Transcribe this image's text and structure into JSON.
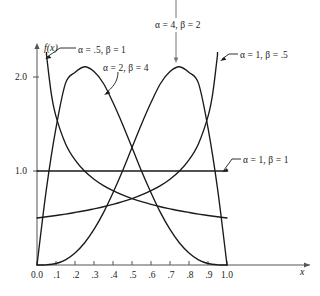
{
  "chart_data": {
    "type": "line",
    "title": "",
    "xlabel": "x",
    "ylabel": "f(x)",
    "xlim": [
      0.0,
      1.0
    ],
    "ylim": [
      0.0,
      2.25
    ],
    "grid": false,
    "legend_position": "inline-annotations",
    "x_ticks": [
      0.0,
      0.1,
      0.2,
      0.3,
      0.4,
      0.5,
      0.6,
      0.7,
      0.8,
      0.9,
      1.0
    ],
    "x_tick_labels": [
      "0.0",
      ".1",
      ".2",
      ".3",
      ".4",
      ".5",
      ".6",
      ".7",
      ".8",
      ".9",
      "1.0"
    ],
    "y_ticks": [
      1.0,
      2.0
    ],
    "y_tick_labels": [
      "1.0",
      "2.0"
    ],
    "series": [
      {
        "name": "alpha = .5, beta = 1",
        "alpha": 0.5,
        "beta": 1,
        "label": "α = .5, β = 1",
        "clipped_at_top": true,
        "x": [
          0.05,
          0.075,
          0.1,
          0.15,
          0.2,
          0.25,
          0.3,
          0.35,
          0.4,
          0.45,
          0.5,
          0.55,
          0.6,
          0.65,
          0.7,
          0.75,
          0.8,
          0.85,
          0.9,
          0.95,
          1.0
        ],
        "y": [
          2.236,
          1.826,
          1.581,
          1.291,
          1.118,
          1.0,
          0.913,
          0.845,
          0.791,
          0.745,
          0.707,
          0.674,
          0.645,
          0.62,
          0.598,
          0.577,
          0.559,
          0.542,
          0.527,
          0.513,
          0.5
        ]
      },
      {
        "name": "alpha = 2, beta = 4",
        "alpha": 2,
        "beta": 4,
        "label": "α = 2, β = 4",
        "clipped_at_top": false,
        "x": [
          0.0,
          0.05,
          0.1,
          0.15,
          0.2,
          0.25,
          0.3,
          0.35,
          0.4,
          0.45,
          0.5,
          0.55,
          0.6,
          0.65,
          0.7,
          0.75,
          0.8,
          0.85,
          0.9,
          0.95,
          1.0
        ],
        "y": [
          0.0,
          0.815,
          1.458,
          1.932,
          2.048,
          2.109,
          2.058,
          1.931,
          1.728,
          1.498,
          1.25,
          0.999,
          0.768,
          0.557,
          0.378,
          0.234,
          0.128,
          0.055,
          0.016,
          0.002,
          0.0
        ]
      },
      {
        "name": "alpha = 1, beta = 1",
        "alpha": 1,
        "beta": 1,
        "label": "α = 1, β = 1",
        "clipped_at_top": false,
        "x": [
          0.0,
          1.0
        ],
        "y": [
          1.0,
          1.0
        ]
      },
      {
        "name": "alpha = 4, beta = 2",
        "alpha": 4,
        "beta": 2,
        "label": "α = 4, β = 2",
        "clipped_at_top": false,
        "x": [
          0.0,
          0.05,
          0.1,
          0.15,
          0.2,
          0.25,
          0.3,
          0.35,
          0.4,
          0.45,
          0.5,
          0.55,
          0.6,
          0.65,
          0.7,
          0.75,
          0.8,
          0.85,
          0.9,
          0.95,
          1.0
        ],
        "y": [
          0.0,
          0.002,
          0.016,
          0.055,
          0.128,
          0.234,
          0.378,
          0.557,
          0.768,
          0.999,
          1.25,
          1.498,
          1.728,
          1.931,
          2.058,
          2.109,
          2.048,
          1.932,
          1.458,
          0.815,
          0.0
        ]
      },
      {
        "name": "alpha = 1, beta = .5",
        "alpha": 1,
        "beta": 0.5,
        "label": "α = 1, β = .5",
        "clipped_at_top": true,
        "x": [
          0.0,
          0.05,
          0.1,
          0.15,
          0.2,
          0.25,
          0.3,
          0.35,
          0.4,
          0.45,
          0.5,
          0.55,
          0.6,
          0.65,
          0.7,
          0.75,
          0.8,
          0.85,
          0.9,
          0.925,
          0.95
        ],
        "y": [
          0.5,
          0.513,
          0.527,
          0.542,
          0.559,
          0.577,
          0.598,
          0.62,
          0.645,
          0.674,
          0.707,
          0.745,
          0.791,
          0.845,
          0.913,
          1.0,
          1.118,
          1.291,
          1.581,
          1.826,
          2.236
        ]
      }
    ],
    "annotations": [
      {
        "id": "ann-a4b2",
        "text": "α = 4, β = 2",
        "pointer": "down-arrow-from-top"
      },
      {
        "id": "ann-a05b1",
        "text": "α = .5, β = 1",
        "pointer": "elbow-left"
      },
      {
        "id": "ann-a2b4",
        "text": "α = 2, β = 4",
        "pointer": "curve-down-left"
      },
      {
        "id": "ann-a1b05",
        "text": "α = 1, β = .5",
        "pointer": "elbow-left"
      },
      {
        "id": "ann-a1b1",
        "text": "α = 1, β = 1",
        "pointer": "elbow-left"
      }
    ]
  },
  "axes": {
    "y_label": "f(x)",
    "x_label": "x",
    "y_tick_2": "2.0",
    "y_tick_1": "1.0"
  },
  "x_tick_labels": {
    "t0": "0.0",
    "t1": ".1",
    "t2": ".2",
    "t3": ".3",
    "t4": ".4",
    "t5": ".5",
    "t6": ".6",
    "t7": ".7",
    "t8": ".8",
    "t9": ".9",
    "t10": "1.0"
  },
  "annotations": {
    "a4b2": "α = 4, β = 2",
    "a05b1": "α = .5, β = 1",
    "a2b4": "α = 2, β = 4",
    "a1b05": "α = 1, β = .5",
    "a1b1": "α = 1, β = 1"
  },
  "colors": {
    "curve": "#1a1a1a",
    "axis": "#555555",
    "background": "#ffffff",
    "pointer": "#777777"
  }
}
